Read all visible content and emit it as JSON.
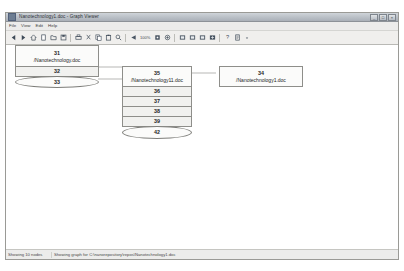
{
  "window": {
    "title": "Nanotechnology1.doc - Graph Viewer",
    "controls": [
      {
        "name": "minimize",
        "glyph": "_"
      },
      {
        "name": "maximize",
        "glyph": "□"
      },
      {
        "name": "close",
        "glyph": "×"
      }
    ]
  },
  "menu": {
    "items": [
      {
        "label": "File"
      },
      {
        "label": "View"
      },
      {
        "label": "Edit"
      },
      {
        "label": "Help"
      }
    ]
  },
  "toolbar": {
    "zoom_label": "100%",
    "groups": [
      {
        "buttons": [
          {
            "name": "back-arrow-icon",
            "icon": "arrow-left"
          },
          {
            "name": "forward-arrow-icon",
            "icon": "arrow-right"
          },
          {
            "name": "home-icon",
            "icon": "home"
          },
          {
            "name": "new-document-icon",
            "icon": "document"
          },
          {
            "name": "open-folder-icon",
            "icon": "folder"
          },
          {
            "name": "save-icon",
            "icon": "save"
          }
        ]
      },
      {
        "buttons": [
          {
            "name": "print-icon",
            "icon": "printer"
          },
          {
            "name": "cut-icon",
            "icon": "scissors"
          },
          {
            "name": "copy-icon",
            "icon": "copy"
          },
          {
            "name": "paste-icon",
            "icon": "clipboard"
          },
          {
            "name": "search-icon",
            "icon": "magnifier"
          }
        ]
      },
      {
        "buttons": [
          {
            "name": "zoom-out-icon",
            "icon": "minus-circle"
          },
          {
            "name": "zoom-reset-icon",
            "icon": "target"
          },
          {
            "name": "zoom-in-icon",
            "icon": "plus-circle"
          },
          {
            "name": "layout-icon",
            "icon": "grid"
          }
        ]
      },
      {
        "buttons": [
          {
            "name": "node-filter-icon",
            "icon": "square-fill"
          },
          {
            "name": "edge-filter-icon",
            "icon": "square-fill"
          },
          {
            "name": "cluster-icon",
            "icon": "square-fill"
          },
          {
            "name": "export-icon",
            "icon": "square-fill"
          }
        ]
      },
      {
        "buttons": [
          {
            "name": "help-icon",
            "icon": "question"
          },
          {
            "name": "properties-icon",
            "icon": "document"
          }
        ]
      }
    ]
  },
  "graph": {
    "groups": [
      {
        "name": "cluster-left",
        "nodes": [
          {
            "name": "node-31",
            "id": "31",
            "label": "/Nanotechnology.doc",
            "shape": "box"
          },
          {
            "name": "node-32",
            "id": "32",
            "label": "",
            "shape": "box"
          },
          {
            "name": "node-33",
            "id": "33",
            "label": "",
            "shape": "ellipse"
          }
        ]
      },
      {
        "name": "cluster-middle",
        "nodes": [
          {
            "name": "node-35",
            "id": "35",
            "label": "/Nanotechnology11.doc",
            "shape": "box"
          },
          {
            "name": "node-36",
            "id": "36",
            "label": "",
            "shape": "box"
          },
          {
            "name": "node-37",
            "id": "37",
            "label": "",
            "shape": "box"
          },
          {
            "name": "node-38",
            "id": "38",
            "label": "",
            "shape": "box"
          },
          {
            "name": "node-39",
            "id": "39",
            "label": "",
            "shape": "box"
          },
          {
            "name": "node-42",
            "id": "42",
            "label": "",
            "shape": "ellipse"
          }
        ]
      },
      {
        "name": "cluster-right",
        "nodes": [
          {
            "name": "node-34",
            "id": "34",
            "label": "/Nanotechnology1.doc",
            "shape": "box"
          }
        ]
      }
    ]
  },
  "status": {
    "nodes_text": "Showing 10 nodes",
    "graph_text": "Showing graph for C:\\nanorepository\\repos\\Nanotechnology1.doc"
  }
}
